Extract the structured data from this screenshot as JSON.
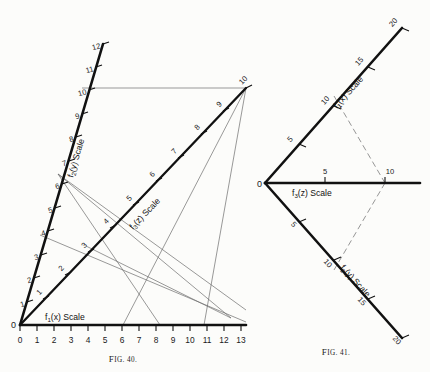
{
  "page": {
    "background": "#fcfcfa",
    "ink": "#111111",
    "construction_color": "#6d6d6d"
  },
  "figures": [
    {
      "id": "fig40",
      "caption": "Fig. 40.",
      "caption_small": "IG. 40.",
      "caption_first": "F",
      "origin_label": "0",
      "type": "nomogram-three-scale-Z-chart",
      "scales": [
        {
          "name": "f1x",
          "label_main": "f",
          "label_sub": "1",
          "label_rest": "(x) Scale",
          "label_text": "f₁(x) Scale",
          "orientation": "horizontal-bottom",
          "ticks": [
            "0",
            "1",
            "2",
            "3",
            "4",
            "5",
            "6",
            "7",
            "8",
            "9",
            "10",
            "11",
            "12",
            "13"
          ],
          "min": 0,
          "max": 13
        },
        {
          "name": "f2y",
          "label_text": "f₂(y) Scale",
          "label_main": "f",
          "label_sub": "2",
          "label_rest": "(y) Scale",
          "orientation": "steep-left-diagonal",
          "ticks": [
            "1",
            "2",
            "3",
            "4",
            "5",
            "6",
            "7",
            "8",
            "9",
            "10",
            "11",
            "12"
          ],
          "min": 0,
          "max": 12
        },
        {
          "name": "f3z",
          "label_text": "f₃(z) Scale",
          "label_main": "f",
          "label_sub": "3",
          "label_rest": "(z) Scale",
          "orientation": "45-degree-diagonal",
          "ticks": [
            "1",
            "2",
            "3",
            "4",
            "5",
            "6",
            "7",
            "8",
            "9",
            "10"
          ],
          "min": 0,
          "max": 10
        }
      ]
    },
    {
      "id": "fig41",
      "caption": "Fig. 41.",
      "caption_small": "IG. 41.",
      "caption_first": "F",
      "origin_label": "0",
      "type": "nomogram-three-scale-fan",
      "scales": [
        {
          "name": "f1x",
          "label_text": "f₁(x) Scale",
          "label_main": "f",
          "label_sub": "1",
          "label_rest": "(x) Scale",
          "orientation": "upper-right-diagonal",
          "ticks": [
            "5",
            "10",
            "15",
            "20"
          ],
          "min": 0,
          "max": 20
        },
        {
          "name": "f3z",
          "label_text": "f₃(z) Scale",
          "label_main": "f",
          "label_sub": "3",
          "label_rest": "(z) Scale",
          "orientation": "horizontal",
          "ticks": [
            "5",
            "10"
          ],
          "min": 0,
          "max": 10
        },
        {
          "name": "f2y",
          "label_text": "f₂(y) Scale",
          "label_main": "f",
          "label_sub": "2",
          "label_rest": "(y) Scale",
          "orientation": "lower-right-diagonal",
          "ticks": [
            "5",
            "10",
            "15",
            "20"
          ],
          "min": 0,
          "max": 20
        }
      ],
      "index_line": {
        "style": "dashed",
        "from_scale": "f1x",
        "from_value": "10",
        "through_scale": "f3z",
        "through_value": "10",
        "to_scale": "f2y",
        "to_value": "10"
      }
    }
  ],
  "fig40_x_ticks": [
    "0",
    "1",
    "2",
    "3",
    "4",
    "5",
    "6",
    "7",
    "8",
    "9",
    "10",
    "11",
    "12",
    "13"
  ],
  "fig40_y_ticks": [
    "1",
    "2",
    "3",
    "4",
    "5",
    "6",
    "7",
    "8",
    "9",
    "10",
    "11",
    "12"
  ],
  "fig40_z_ticks": [
    "1",
    "2",
    "3",
    "4",
    "5",
    "6",
    "7",
    "8",
    "9",
    "10"
  ],
  "fig41_upper_ticks": [
    "5",
    "10",
    "15",
    "20"
  ],
  "fig41_horiz_ticks": [
    "5",
    "10"
  ],
  "fig41_lower_ticks": [
    "5",
    "10",
    "15",
    "20"
  ]
}
